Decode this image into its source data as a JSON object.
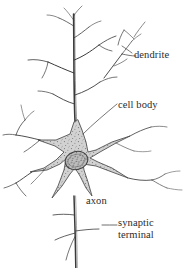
{
  "figure": {
    "style": "hand-drawn pen-and-ink line drawing, stippled cell body",
    "background_color": "#ffffff",
    "ink_color": "#2b2b2b",
    "soma_fill_color": "#d2d2d2",
    "soma_stipple_color": "#6e6e6e",
    "nucleus_fill_color": "#bdbdbd"
  },
  "labels": {
    "dendrite": "dendrite",
    "cell_body": "cell body",
    "axon": "axon",
    "synaptic_terminal_line1": "synaptic",
    "synaptic_terminal_line2": "terminal"
  },
  "parts": [
    {
      "name": "dendrite",
      "label": "dendrite",
      "description": "branching apical and basal dendritic tree extending upward and sideways from the cell body",
      "leader_line": true
    },
    {
      "name": "cell-body",
      "label": "cell body",
      "description": "star-shaped stippled soma containing the nucleus",
      "leader_line": true
    },
    {
      "name": "axon",
      "label": "axon",
      "description": "single long process descending from the bottom of the cell body",
      "leader_line": false
    },
    {
      "name": "synaptic-terminal",
      "label": "synaptic terminal",
      "description": "terminal branches at the end of the axon",
      "leader_line": true
    }
  ]
}
